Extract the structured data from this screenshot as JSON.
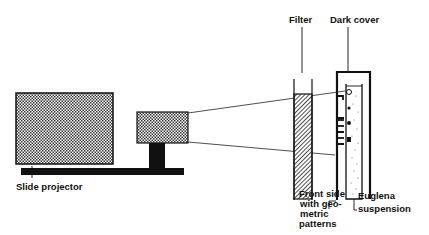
{
  "diagram": {
    "type": "apparatus-setup",
    "labels": {
      "filter": "Filter",
      "dark_cover": "Dark cover",
      "slide_projector": "Slide projector",
      "front_side_line1": "Front side",
      "front_side_line2": "with geo-",
      "front_side_line3": "metric",
      "front_side_line4": "patterns",
      "euglena_line1": "Euglena",
      "euglena_line2": "suspension"
    },
    "components": [
      {
        "name": "Slide projector",
        "shape": "stippled box on base rail"
      },
      {
        "name": "Projector lens",
        "shape": "stippled box on black post"
      },
      {
        "name": "Filter",
        "shape": "hatched vertical panel"
      },
      {
        "name": "Dark cover",
        "shape": "open box enclosing cuvette"
      },
      {
        "name": "Front side with geometric patterns",
        "shape": "stepped front wall with four openings"
      },
      {
        "name": "Euglena suspension",
        "shape": "cuvette with dotted fluid"
      }
    ],
    "colors": {
      "ink": "#111111",
      "background": "#ffffff"
    }
  }
}
